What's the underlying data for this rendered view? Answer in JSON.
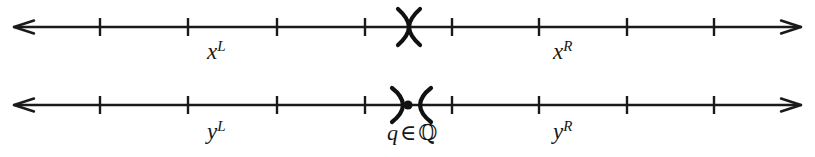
{
  "figure": {
    "background_color": "#ffffff",
    "stroke_color": "#1a1a1a",
    "width": 815,
    "height": 157
  },
  "lines": [
    {
      "id": "line-x",
      "axis_y": 27,
      "x_start": 14,
      "x_end": 801,
      "left_arrow": true,
      "right_arrow": true,
      "ticks": [
        100,
        188,
        277,
        365,
        452,
        539,
        627,
        714
      ],
      "cut": {
        "type": "paren-paren",
        "center_x": 409,
        "has_point": false,
        "gap": 0,
        "description": "closing and opening parenthesis meeting, no rational point at the cut"
      },
      "left_label": {
        "base": "x",
        "sup": "L"
      },
      "right_label": {
        "base": "x",
        "sup": "R"
      }
    },
    {
      "id": "line-y",
      "axis_y": 105,
      "x_start": 14,
      "x_end": 801,
      "left_arrow": true,
      "right_arrow": true,
      "ticks": [
        100,
        188,
        277,
        365,
        452,
        539,
        627,
        714
      ],
      "cut": {
        "type": "paren-point-paren",
        "center_x": 409,
        "has_point": true,
        "gap": 9,
        "description": "closing parenthesis with filled point, then opening parenthesis"
      },
      "left_label": {
        "base": "y",
        "sup": "L"
      },
      "right_label": {
        "base": "y",
        "sup": "R"
      },
      "cut_label": {
        "variable": "q",
        "operator": "∈",
        "set": "ℚ"
      }
    }
  ]
}
